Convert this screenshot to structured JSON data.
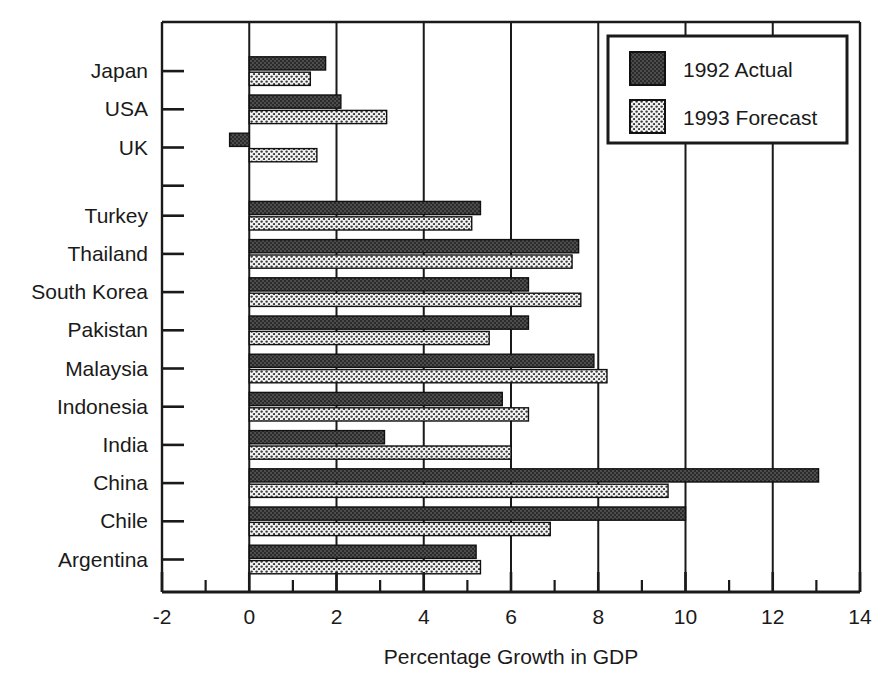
{
  "chart_data": {
    "type": "bar",
    "orientation": "horizontal",
    "title": "",
    "xlabel": "Percentage Growth in GDP",
    "ylabel": "",
    "xlim": [
      -2,
      14
    ],
    "xticks": [
      -2,
      0,
      2,
      4,
      6,
      8,
      10,
      12,
      14
    ],
    "xtick_labels": [
      "-2",
      "0",
      "2",
      "4",
      "6",
      "8",
      "10",
      "12",
      "14"
    ],
    "minor_tick_step": 1,
    "grid": "vertical-major",
    "legend_position": "top-right",
    "categories": [
      "Japan",
      "USA",
      "UK",
      "Turkey",
      "Thailand",
      "South Korea",
      "Pakistan",
      "Malaysia",
      "Indonesia",
      "India",
      "China",
      "Chile",
      "Argentina"
    ],
    "group_break_after": "UK",
    "series": [
      {
        "name": "1992 Actual",
        "fill": "dark-dotted",
        "color": "#4a4a4a",
        "values": [
          1.75,
          2.1,
          -0.45,
          5.3,
          7.55,
          6.4,
          6.4,
          7.9,
          5.8,
          3.1,
          13.05,
          10.0,
          5.2
        ]
      },
      {
        "name": "1993 Forecast",
        "fill": "light-dotted",
        "color": "#e8e8e8",
        "values": [
          1.4,
          3.15,
          1.55,
          5.1,
          7.4,
          7.6,
          5.5,
          8.2,
          6.4,
          6.0,
          9.6,
          6.9,
          5.3
        ]
      }
    ]
  },
  "legend": {
    "items": [
      {
        "label": "1992 Actual",
        "swatch": "dark-dotted"
      },
      {
        "label": "1993 Forecast",
        "swatch": "light-dotted"
      }
    ]
  }
}
